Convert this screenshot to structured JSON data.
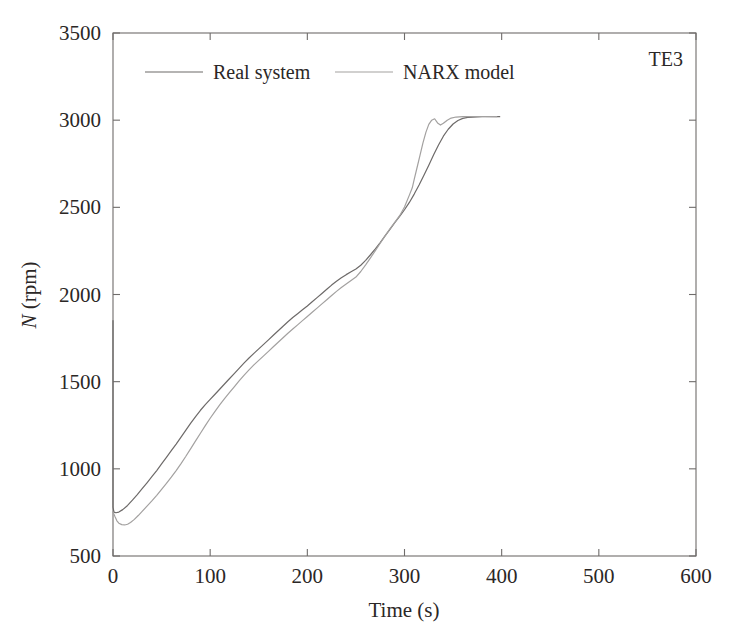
{
  "chart_data": {
    "type": "line",
    "title": "",
    "annotation": "TE3",
    "xlabel": "Time (s)",
    "ylabel": "N (rpm)",
    "ylabel_italic_part": "N",
    "ylabel_rest_part": " (rpm)",
    "xlim": [
      0,
      600
    ],
    "ylim": [
      500,
      3500
    ],
    "xticks": [
      0,
      100,
      200,
      300,
      400,
      500,
      600
    ],
    "xtick_labels": [
      "0",
      "100",
      "200",
      "300",
      "400",
      "500",
      "600"
    ],
    "yticks": [
      500,
      1000,
      1500,
      2000,
      2500,
      3000,
      3500
    ],
    "ytick_labels": [
      "500",
      "1000",
      "1500",
      "2000",
      "2500",
      "3000",
      "3500"
    ],
    "grid": false,
    "legend_position": "top-center-inside",
    "series": [
      {
        "name": "Real system",
        "color": "#6d6a69",
        "width": 1.2,
        "points": [
          [
            0,
            1850
          ],
          [
            0,
            1500
          ],
          [
            0,
            1150
          ],
          [
            0,
            900
          ],
          [
            0,
            780
          ],
          [
            1,
            752
          ],
          [
            3,
            748
          ],
          [
            6,
            752
          ],
          [
            10,
            766
          ],
          [
            15,
            790
          ],
          [
            20,
            820
          ],
          [
            25,
            852
          ],
          [
            30,
            886
          ],
          [
            35,
            920
          ],
          [
            40,
            955
          ],
          [
            45,
            990
          ],
          [
            50,
            1028
          ],
          [
            55,
            1066
          ],
          [
            60,
            1104
          ],
          [
            65,
            1142
          ],
          [
            70,
            1182
          ],
          [
            75,
            1222
          ],
          [
            80,
            1262
          ],
          [
            85,
            1300
          ],
          [
            90,
            1336
          ],
          [
            95,
            1368
          ],
          [
            100,
            1398
          ],
          [
            105,
            1428
          ],
          [
            110,
            1458
          ],
          [
            115,
            1488
          ],
          [
            120,
            1518
          ],
          [
            125,
            1548
          ],
          [
            130,
            1578
          ],
          [
            135,
            1608
          ],
          [
            140,
            1636
          ],
          [
            145,
            1662
          ],
          [
            150,
            1688
          ],
          [
            155,
            1714
          ],
          [
            160,
            1740
          ],
          [
            165,
            1766
          ],
          [
            170,
            1792
          ],
          [
            175,
            1818
          ],
          [
            180,
            1844
          ],
          [
            185,
            1868
          ],
          [
            190,
            1890
          ],
          [
            195,
            1912
          ],
          [
            200,
            1934
          ],
          [
            205,
            1958
          ],
          [
            210,
            1982
          ],
          [
            215,
            2006
          ],
          [
            220,
            2030
          ],
          [
            225,
            2054
          ],
          [
            230,
            2076
          ],
          [
            235,
            2096
          ],
          [
            240,
            2114
          ],
          [
            245,
            2130
          ],
          [
            250,
            2146
          ],
          [
            255,
            2168
          ],
          [
            260,
            2196
          ],
          [
            265,
            2228
          ],
          [
            270,
            2262
          ],
          [
            275,
            2298
          ],
          [
            280,
            2336
          ],
          [
            285,
            2374
          ],
          [
            290,
            2412
          ],
          [
            295,
            2448
          ],
          [
            300,
            2486
          ],
          [
            305,
            2528
          ],
          [
            310,
            2576
          ],
          [
            315,
            2628
          ],
          [
            320,
            2684
          ],
          [
            325,
            2742
          ],
          [
            330,
            2802
          ],
          [
            335,
            2858
          ],
          [
            340,
            2908
          ],
          [
            345,
            2948
          ],
          [
            350,
            2978
          ],
          [
            355,
            2998
          ],
          [
            360,
            3010
          ],
          [
            365,
            3016
          ],
          [
            370,
            3018
          ],
          [
            380,
            3020
          ],
          [
            390,
            3020
          ],
          [
            398,
            3020
          ]
        ]
      },
      {
        "name": "NARX model",
        "color": "#a3a1a0",
        "width": 1.2,
        "points": [
          [
            0,
            752
          ],
          [
            2,
            726
          ],
          [
            4,
            702
          ],
          [
            6,
            688
          ],
          [
            9,
            680
          ],
          [
            12,
            678
          ],
          [
            15,
            682
          ],
          [
            18,
            692
          ],
          [
            22,
            710
          ],
          [
            26,
            732
          ],
          [
            30,
            756
          ],
          [
            35,
            786
          ],
          [
            40,
            816
          ],
          [
            45,
            848
          ],
          [
            50,
            882
          ],
          [
            55,
            916
          ],
          [
            60,
            952
          ],
          [
            65,
            990
          ],
          [
            70,
            1030
          ],
          [
            75,
            1072
          ],
          [
            80,
            1116
          ],
          [
            85,
            1160
          ],
          [
            90,
            1204
          ],
          [
            95,
            1248
          ],
          [
            100,
            1290
          ],
          [
            105,
            1330
          ],
          [
            110,
            1368
          ],
          [
            115,
            1404
          ],
          [
            120,
            1438
          ],
          [
            125,
            1472
          ],
          [
            130,
            1506
          ],
          [
            135,
            1538
          ],
          [
            140,
            1568
          ],
          [
            145,
            1596
          ],
          [
            150,
            1622
          ],
          [
            155,
            1648
          ],
          [
            160,
            1674
          ],
          [
            165,
            1700
          ],
          [
            170,
            1726
          ],
          [
            175,
            1752
          ],
          [
            180,
            1778
          ],
          [
            185,
            1802
          ],
          [
            190,
            1826
          ],
          [
            195,
            1850
          ],
          [
            200,
            1874
          ],
          [
            205,
            1898
          ],
          [
            210,
            1922
          ],
          [
            215,
            1946
          ],
          [
            220,
            1970
          ],
          [
            225,
            1994
          ],
          [
            230,
            2018
          ],
          [
            235,
            2040
          ],
          [
            240,
            2060
          ],
          [
            245,
            2080
          ],
          [
            250,
            2100
          ],
          [
            255,
            2132
          ],
          [
            260,
            2170
          ],
          [
            265,
            2210
          ],
          [
            270,
            2252
          ],
          [
            275,
            2294
          ],
          [
            280,
            2336
          ],
          [
            285,
            2376
          ],
          [
            290,
            2414
          ],
          [
            295,
            2452
          ],
          [
            300,
            2502
          ],
          [
            305,
            2570
          ],
          [
            308,
            2612
          ],
          [
            310,
            2660
          ],
          [
            313,
            2730
          ],
          [
            316,
            2800
          ],
          [
            319,
            2870
          ],
          [
            322,
            2930
          ],
          [
            325,
            2976
          ],
          [
            328,
            3000
          ],
          [
            331,
            3008
          ],
          [
            334,
            2984
          ],
          [
            337,
            2972
          ],
          [
            340,
            2982
          ],
          [
            344,
            3000
          ],
          [
            348,
            3012
          ],
          [
            353,
            3018
          ],
          [
            360,
            3020
          ],
          [
            370,
            3021
          ],
          [
            382,
            3021
          ],
          [
            395,
            3020
          ]
        ]
      }
    ]
  },
  "legend": {
    "items": [
      {
        "label": "Real system",
        "color": "#6d6a69"
      },
      {
        "label": "NARX model",
        "color": "#a3a1a0"
      }
    ]
  }
}
